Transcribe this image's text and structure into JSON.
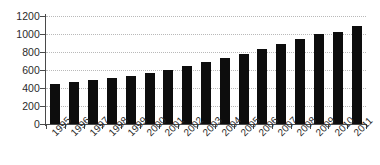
{
  "chart_data": {
    "type": "bar",
    "title": "",
    "subtitle": "",
    "xlabel": "",
    "ylabel": "",
    "categories": [
      "1995",
      "1996",
      "1997",
      "1998",
      "1999",
      "2000",
      "2001",
      "2002",
      "2003",
      "2004",
      "2005",
      "2006",
      "2007",
      "2008",
      "2009",
      "2010",
      "2011"
    ],
    "values": [
      450,
      470,
      490,
      512,
      535,
      565,
      605,
      645,
      690,
      732,
      780,
      838,
      885,
      940,
      998,
      1022,
      1088
    ],
    "series": [
      {
        "name": "Series 1",
        "values": [
          450,
          470,
          490,
          512,
          535,
          565,
          605,
          645,
          690,
          732,
          780,
          838,
          885,
          940,
          998,
          1022,
          1088
        ]
      }
    ],
    "ylim": [
      0,
      1200
    ],
    "ytick_values": [
      0,
      200,
      400,
      600,
      800,
      1000,
      1200
    ],
    "ytick_labels": [
      "0",
      "200",
      "400",
      "600",
      "800",
      "1000",
      "1200"
    ],
    "xtick_labels": [
      "1995",
      "1996",
      "1997",
      "1998",
      "1999",
      "2000",
      "2001",
      "2002",
      "2003",
      "2004",
      "2005",
      "2006",
      "2007",
      "2008",
      "2009",
      "2010",
      "2011"
    ],
    "xtick_label_rotation": -45,
    "grid": true,
    "grid_axis": "y",
    "grid_style": "dotted",
    "legend": false,
    "legend_position": "none",
    "annotations": [],
    "colors": {
      "bar": "#0d0d0d",
      "grid": "#b9b9b9",
      "axis": "#4a4a4a",
      "text": "#2b2b2b",
      "background": "#ffffff"
    }
  }
}
